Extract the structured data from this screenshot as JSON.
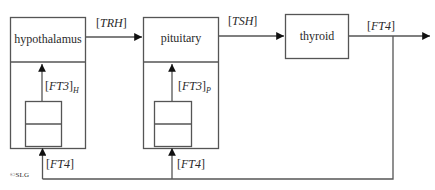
{
  "diagram": {
    "nodes": {
      "hypothalamus": {
        "label": "hypothalamus"
      },
      "pituitary": {
        "label": "pituitary"
      },
      "thyroid": {
        "label": "thyroid"
      }
    },
    "edges": {
      "trh": {
        "open": "[",
        "var": "TRH",
        "close": "]"
      },
      "tsh": {
        "open": "[",
        "var": "TSH",
        "close": "]"
      },
      "ft4_out": {
        "open": "[",
        "var": "FT4",
        "close": "]"
      },
      "ft3_h": {
        "open": "[",
        "var": "FT3",
        "close": "]",
        "sub": "H"
      },
      "ft3_p": {
        "open": "[",
        "var": "FT3",
        "close": "]",
        "sub": "P"
      },
      "ft4_h": {
        "open": "[",
        "var": "FT4",
        "close": "]"
      },
      "ft4_p": {
        "open": "[",
        "var": "FT4",
        "close": "]"
      }
    },
    "copyright": "©SLG",
    "colors": {
      "line": "#555555",
      "text": "#2a2a2a"
    }
  }
}
